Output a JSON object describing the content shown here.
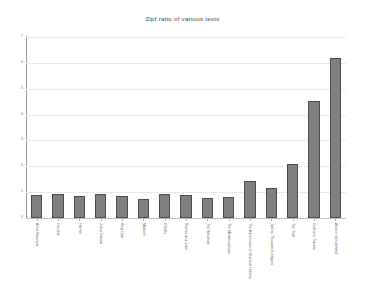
{
  "chart_data": {
    "type": "bar",
    "title": "Zipf ratio of various texts",
    "xlabel": "",
    "ylabel": "",
    "ylim": [
      0,
      7
    ],
    "yticks": [
      0,
      1,
      2,
      3,
      4,
      5,
      6,
      7
    ],
    "ytick_labels": [
      "0",
      "1",
      "2",
      "3",
      "4",
      "5",
      "6",
      "7"
    ],
    "grid": true,
    "legend": "none",
    "bar_color": "#808080",
    "bar_edge_color": "#4c4c4c",
    "gridline_color": "#e9e9ea",
    "axis_color": "#9a9a9a",
    "categories": [
      "Anna Karenina",
      "Candide",
      "Hamlet",
      "Julius Caesar",
      "King Lear",
      "Macbeth",
      "Othello",
      "Romeo and Juliet",
      "The Sandman",
      "The Metamorphosis",
      "The Adventures of Sherlock Holmes",
      "Twenty Thousand Leagues",
      "The Trial",
      "Gulliver's Travels",
      "Alice in Wonderland"
    ],
    "values": [
      0.88,
      0.92,
      0.85,
      0.93,
      0.86,
      0.72,
      0.92,
      0.88,
      0.79,
      0.82,
      1.42,
      1.15,
      2.08,
      4.52,
      6.18
    ]
  }
}
